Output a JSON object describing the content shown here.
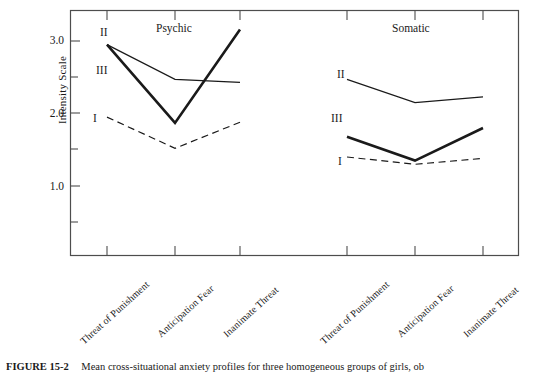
{
  "figure": {
    "caption_label": "FIGURE 15-2",
    "caption_text": "Mean cross-situational anxiety profiles for three homogeneous groups of girls, ob"
  },
  "chart_data": {
    "type": "line",
    "title": "",
    "xlabel": "",
    "ylabel": "Intensity Scale",
    "ylim": [
      0.25,
      3.45
    ],
    "ytick_labels": [
      "3.0",
      "2.0",
      "1.0"
    ],
    "ytick_values": [
      3.0,
      2.0,
      1.0
    ],
    "yminor_values": [
      2.5,
      1.5,
      0.5
    ],
    "grid": false,
    "legend_position": "inline-left-of-series",
    "panels": [
      {
        "name": "Psychic",
        "categories": [
          "Threat of Punishment",
          "Anticipation Fear",
          "Inanimate Threat"
        ],
        "series": [
          {
            "name": "I",
            "style": "dashed",
            "values": [
              1.95,
              1.52,
              1.88
            ]
          },
          {
            "name": "II",
            "style": "thin-solid",
            "values": [
              2.95,
              2.47,
              2.43
            ]
          },
          {
            "name": "III",
            "style": "thick-solid",
            "values": [
              2.95,
              1.87,
              3.16
            ]
          }
        ]
      },
      {
        "name": "Somatic",
        "categories": [
          "Threat of Punishment",
          "Anticipation Fear",
          "Inanimate Threat"
        ],
        "series": [
          {
            "name": "I",
            "style": "dashed",
            "values": [
              1.4,
              1.3,
              1.38
            ]
          },
          {
            "name": "II",
            "style": "thin-solid",
            "values": [
              2.47,
              2.15,
              2.23
            ]
          },
          {
            "name": "III",
            "style": "thick-solid",
            "values": [
              1.68,
              1.35,
              1.8
            ]
          }
        ]
      }
    ],
    "series_inline_labels": [
      {
        "panel": "Psychic",
        "name": "II",
        "x": 100,
        "y": 30
      },
      {
        "panel": "Psychic",
        "name": "III",
        "x": 96,
        "y": 68
      },
      {
        "panel": "Psychic",
        "name": "I",
        "x": 92,
        "y": 115
      },
      {
        "panel": "Somatic",
        "name": "II",
        "x": 337,
        "y": 72
      },
      {
        "panel": "Somatic",
        "name": "III",
        "x": 331,
        "y": 115
      },
      {
        "panel": "Somatic",
        "name": "I",
        "x": 337,
        "y": 158
      }
    ],
    "colors": {
      "line": "#1a1a1a",
      "axis": "#4d4d4d",
      "background": "#ffffff"
    }
  }
}
